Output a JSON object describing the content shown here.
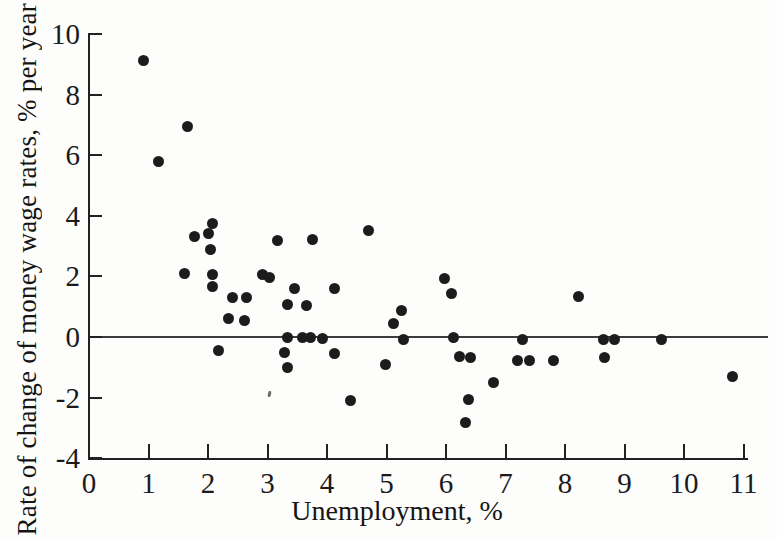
{
  "chart_data": {
    "type": "scatter",
    "title": "",
    "xlabel": "Unemployment, %",
    "ylabel": "Rate of change of money wage rates, % per year",
    "xlim": [
      0,
      11
    ],
    "ylim": [
      -4,
      10
    ],
    "x_ticks": [
      0,
      1,
      2,
      3,
      4,
      5,
      6,
      7,
      8,
      9,
      10,
      11
    ],
    "y_ticks": [
      10,
      8,
      6,
      4,
      2,
      0,
      -2,
      -4
    ],
    "grid": false,
    "legend": null,
    "zero_line_y": 0,
    "marker_color": "#1c1c1c",
    "axis_color": "#222222",
    "points": [
      [
        0.91,
        9.11
      ],
      [
        1.65,
        6.95
      ],
      [
        1.16,
        5.78
      ],
      [
        2.08,
        3.73
      ],
      [
        1.78,
        3.33
      ],
      [
        2.0,
        3.43
      ],
      [
        2.05,
        2.9
      ],
      [
        3.16,
        3.17
      ],
      [
        3.76,
        3.23
      ],
      [
        4.69,
        3.5
      ],
      [
        1.6,
        2.08
      ],
      [
        2.08,
        2.05
      ],
      [
        2.08,
        1.68
      ],
      [
        2.42,
        1.32
      ],
      [
        2.64,
        1.3
      ],
      [
        2.91,
        2.05
      ],
      [
        3.04,
        1.95
      ],
      [
        3.45,
        1.6
      ],
      [
        3.34,
        1.06
      ],
      [
        3.65,
        1.03
      ],
      [
        4.13,
        1.6
      ],
      [
        2.34,
        0.6
      ],
      [
        2.61,
        0.56
      ],
      [
        5.97,
        1.93
      ],
      [
        6.1,
        1.42
      ],
      [
        5.26,
        0.88
      ],
      [
        5.11,
        0.44
      ],
      [
        3.34,
        -0.03
      ],
      [
        3.58,
        -0.03
      ],
      [
        3.73,
        -0.03
      ],
      [
        3.93,
        -0.06
      ],
      [
        5.28,
        -0.07
      ],
      [
        6.12,
        -0.03
      ],
      [
        7.28,
        -0.07
      ],
      [
        2.17,
        -0.46
      ],
      [
        3.29,
        -0.5
      ],
      [
        3.33,
        -1.0
      ],
      [
        4.12,
        -0.53
      ],
      [
        4.99,
        -0.92
      ],
      [
        4.39,
        -2.11
      ],
      [
        6.22,
        -0.63
      ],
      [
        6.42,
        -0.69
      ],
      [
        6.79,
        -1.49
      ],
      [
        6.37,
        -2.05
      ],
      [
        6.32,
        -2.81
      ],
      [
        7.21,
        -0.76
      ],
      [
        7.41,
        -0.76
      ],
      [
        7.8,
        -0.79
      ],
      [
        8.22,
        1.35
      ],
      [
        8.64,
        -0.07
      ],
      [
        8.84,
        -0.07
      ],
      [
        9.63,
        -0.07
      ],
      [
        8.67,
        -0.69
      ],
      [
        10.81,
        -1.29
      ]
    ]
  }
}
